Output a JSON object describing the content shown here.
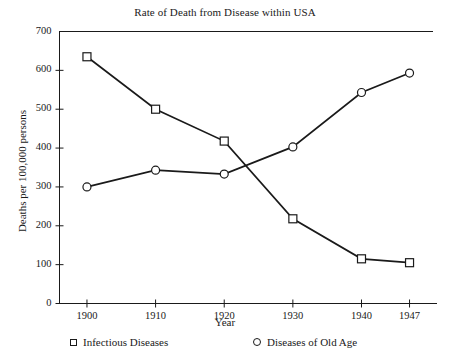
{
  "chart_data": {
    "type": "line",
    "title": "Rate of Death from Disease within USA",
    "xlabel": "Year",
    "ylabel": "Deaths per 100,000 persons",
    "categories": [
      "1900",
      "1910",
      "1920",
      "1930",
      "1940",
      "1947"
    ],
    "x": [
      1900,
      1910,
      1920,
      1930,
      1940,
      1947
    ],
    "xlim": [
      1896,
      1951
    ],
    "ylim": [
      0,
      700
    ],
    "yticks": [
      "0",
      "100",
      "200",
      "300",
      "400",
      "500",
      "600",
      "700"
    ],
    "ytick_values": [
      0,
      100,
      200,
      300,
      400,
      500,
      600,
      700
    ],
    "grid": false,
    "legend_position": "below-axes",
    "series": [
      {
        "name": "Infectious Diseases",
        "marker": "square",
        "color": "#1a1a1a",
        "values": [
          635,
          500,
          418,
          218,
          115,
          105
        ]
      },
      {
        "name": "Diseases of Old Age",
        "marker": "circle",
        "color": "#1a1a1a",
        "values": [
          300,
          343,
          333,
          403,
          543,
          593
        ]
      }
    ]
  },
  "legend": {
    "items": [
      {
        "label": "Infectious Diseases",
        "marker": "square-marker-icon"
      },
      {
        "label": "Diseases of Old Age",
        "marker": "circle-marker-icon"
      }
    ]
  }
}
